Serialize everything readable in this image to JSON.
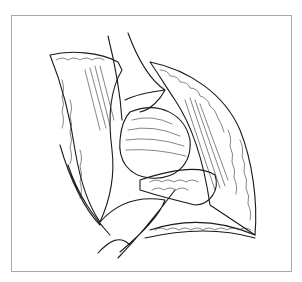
{
  "figure": {
    "frame_color": "#a9a9a9",
    "ink_color": "#1a1a1a",
    "background": "#ffffff"
  }
}
